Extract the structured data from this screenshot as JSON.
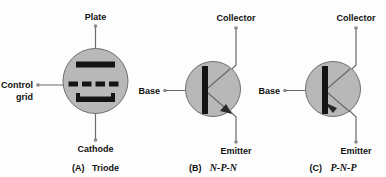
{
  "figure": {
    "background_color": "#fdfdfd",
    "envelope_fill": "#b8b8b8",
    "envelope_stroke": "#6f6f6f",
    "electrode_color": "#141414",
    "lead_color": "#6a6a6a",
    "text_color": "#111111"
  },
  "panels": [
    {
      "id": "triode",
      "caption_prefix": "(A)",
      "caption_name": "Triode",
      "caption_italic": false,
      "terminals": {
        "top": "Plate",
        "left_line1": "Control",
        "left_line2": "grid",
        "bottom": "Cathode"
      },
      "electrodes": [
        "plate-bar",
        "grid-dashes",
        "cathode-bracket"
      ]
    },
    {
      "id": "npn",
      "caption_prefix": "(B)",
      "caption_name": "N-P-N",
      "caption_italic": true,
      "terminals": {
        "top": "Collector",
        "left": "Base",
        "bottom": "Emitter"
      },
      "arrow_direction": "outward",
      "electrodes": [
        "base-bar",
        "collector-lead",
        "emitter-lead-arrow"
      ]
    },
    {
      "id": "pnp",
      "caption_prefix": "(C)",
      "caption_name": "P-N-P",
      "caption_italic": true,
      "terminals": {
        "top": "Collector",
        "left": "Base",
        "bottom": "Emitter"
      },
      "arrow_direction": "inward",
      "electrodes": [
        "base-bar",
        "collector-lead",
        "emitter-lead-arrow"
      ]
    }
  ]
}
